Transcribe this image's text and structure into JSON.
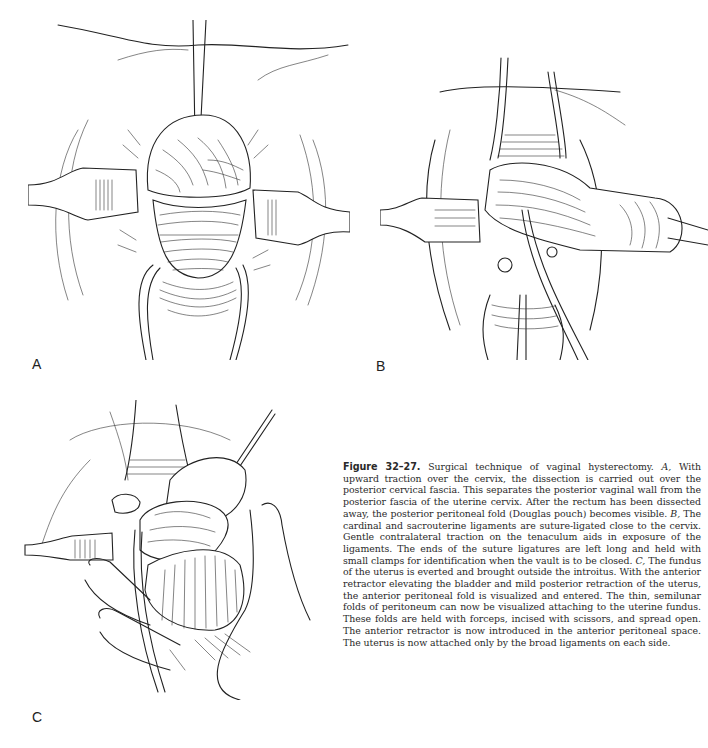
{
  "figure": {
    "number_label": "Figure 32–27.",
    "caption_segments": [
      {
        "text": "Surgical technique of vaginal hysterectomy. ",
        "style": "normal"
      },
      {
        "text": "A,",
        "style": "italic"
      },
      {
        "text": " With upward traction over the cervix, the dissection is carried out over the posterior cervical fascia. This separates the posterior vaginal wall from the posterior fascia of the uterine cervix. After the rectum has been dissected away, the posterior peritoneal fold (Douglas pouch) becomes visible. ",
        "style": "normal"
      },
      {
        "text": "B,",
        "style": "italic"
      },
      {
        "text": " The cardinal and sacrouterine ligaments are suture-ligated close to the cervix. Gentle contralateral traction on the tenaculum aids in exposure of the ligaments. The ends of the suture ligatures are left long and held with small clamps for identification when the vault is to be closed. ",
        "style": "normal"
      },
      {
        "text": "C,",
        "style": "italic"
      },
      {
        "text": " The fundus of the uterus is everted and brought outside the introitus. With the anterior retractor elevating the bladder and mild posterior retraction of the uterus, the anterior peritoneal fold is visualized and entered. The thin, semilunar folds of peritoneum can now be visualized attaching to the uterine fundus. These folds are held with forceps, incised with scissors, and spread open. The anterior retractor is now introduced in the anterior peritoneal space. The uterus is now attached only by the broad ligaments on each side.",
        "style": "normal"
      }
    ]
  },
  "panels": [
    {
      "id": "A",
      "label": "A",
      "illustration": "Upward traction on cervix with tenaculum; lateral retractors; posterior dissection exposing Douglas pouch"
    },
    {
      "id": "B",
      "label": "B",
      "illustration": "Cervix retracted laterally with tenaculum; cardinal and sacrouterine ligaments suture-ligated; clamps on ligature ends"
    },
    {
      "id": "C",
      "label": "C",
      "illustration": "Uterine fundus everted through introitus held in hand; anterior retractor; forceps on peritoneal folds"
    }
  ]
}
